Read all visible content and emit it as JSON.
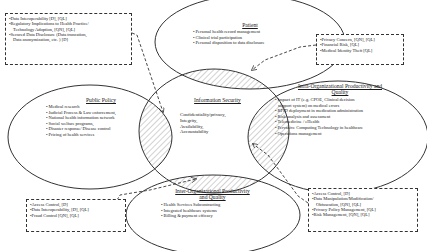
{
  "diagram": {
    "center": {
      "title": "Information Security",
      "lines": [
        "Confidentiality/privacy,",
        "Integrity,",
        "Availability,",
        "Accountability"
      ]
    },
    "patient": {
      "title": "Patient",
      "items": [
        "Personal health record management",
        "Clinical trial participation",
        "Personal disposition to data disclosure"
      ]
    },
    "public_policy": {
      "title": "Public Policy",
      "items": [
        "Medical research",
        "Judicial Process & Law enforcement,",
        "National health information network",
        "Social welfare programs,",
        "Disaster response/ Disease control",
        "Pricing of health services"
      ]
    },
    "intra_org": {
      "title_line1": "Intra-Organizational Productivity and",
      "title_line2": "Quality",
      "items": [
        "Impact of IT (e.g. CPOE, Clinical decision",
        "RFID deployment in medication administration",
        "Risk analysis and assessment",
        "Telemedicine / eHealth",
        "Pervasive Computing Technology in healthcare",
        "Operations management"
      ],
      "item0_cont": "support system) on medical errors"
    },
    "inter_org": {
      "title_line1": "Inter-Organizational Productivity",
      "title_line2": "and Quality",
      "items": [
        "Health Services Subcontracting",
        "Integrated healthcare systems",
        "Billing & payment efficacy"
      ]
    },
    "box_top_left": {
      "lines": [
        "•Data Interoperability [D], [QL]",
        "•Regulatory Implications to Health Practice/",
        "Technology Adoption, [QN], [QL]",
        "•Secured Data Disclosure (Data truncation,",
        "Data anonymization, etc. ) [D]"
      ]
    },
    "box_top_right": {
      "lines": [
        "•Privacy Concern, [QN], [QL]",
        "•Financial Risk, [QL]",
        "•Medical Identity Theft [QL]"
      ]
    },
    "box_bottom_left": {
      "lines": [
        "•Access Control, [D]",
        "•Data Interoperability, [D], [QL]",
        "•Fraud Control [QN], [QL]"
      ]
    },
    "box_bottom_right": {
      "lines": [
        "•Access Control, [D]",
        "•Data Manipulation/Modification/",
        "Obfuscation, [QN], [QL]",
        "•Privacy Policy Management, [QL]",
        "•Risk Management, [QN], [QL]"
      ]
    },
    "colors": {
      "stroke": "#333333",
      "hatch": "#555555",
      "background": "#ffffff"
    }
  }
}
